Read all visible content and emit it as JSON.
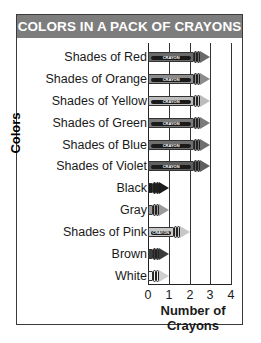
{
  "chart_data": {
    "type": "bar",
    "orientation": "horizontal",
    "title": "COLORS IN A PACK OF CRAYONS",
    "xlabel": "Number of Crayons",
    "ylabel": "Colors",
    "categories": [
      "Shades of Red",
      "Shades of Orange",
      "Shades of Yellow",
      "Shades of Green",
      "Shades of Blue",
      "Shades of Violet",
      "Black",
      "Gray",
      "Shades of Pink",
      "Brown",
      "White"
    ],
    "values": [
      3,
      3,
      3,
      3,
      3,
      3,
      1,
      1,
      2,
      1,
      1
    ],
    "xlim": [
      0,
      4
    ],
    "xticks": [
      "0",
      "1",
      "2",
      "3",
      "4"
    ],
    "grid": "vertical",
    "legend": "none",
    "bar_style": "crayon pictograph",
    "crayon_text": "CRAYON"
  },
  "colors": {
    "title_bar": "#7d7d7d",
    "title_text": "#ffffff",
    "frame": "#3a3a3a",
    "crayon_shades": [
      "#6a6a6a",
      "#8c8c8c",
      "#bdbdbd",
      "#7a7a7a",
      "#6f6f6f",
      "#5e5e5e",
      "#1c1c1c",
      "#9a9a9a",
      "#c8c8c8",
      "#3c3c3c",
      "#f2f2f2"
    ]
  }
}
